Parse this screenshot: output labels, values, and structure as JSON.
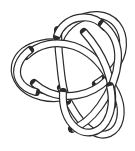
{
  "figure": {
    "title": "Trefoil knot diagram",
    "background_color": "#ffffff",
    "line_color": "#2b2b2b",
    "tube_fill_color": "#ffffff",
    "tube_width_px": 6,
    "outline_width_px": 1,
    "crossing_count": 3,
    "lobe_count": 3,
    "canvas": {
      "width": 135,
      "height": 151
    }
  },
  "chart_data": {
    "type": "diagram",
    "title": "Trefoil knot diagram",
    "crossings": [
      {
        "name": "upper-left-crossing",
        "x": 64,
        "y": 45,
        "over_strand": "vertical"
      },
      {
        "name": "lower-left-crossing",
        "x": 64,
        "y": 92,
        "over_strand": "horizontal"
      },
      {
        "name": "right-crossing",
        "x": 92,
        "y": 70,
        "over_strand": "descending"
      }
    ],
    "lobes": [
      {
        "name": "left-lobe",
        "center_x": 48,
        "center_y": 68
      },
      {
        "name": "upper-right-lobe",
        "center_x": 95,
        "center_y": 45
      },
      {
        "name": "lower-lobe",
        "center_x": 82,
        "center_y": 108
      }
    ]
  }
}
